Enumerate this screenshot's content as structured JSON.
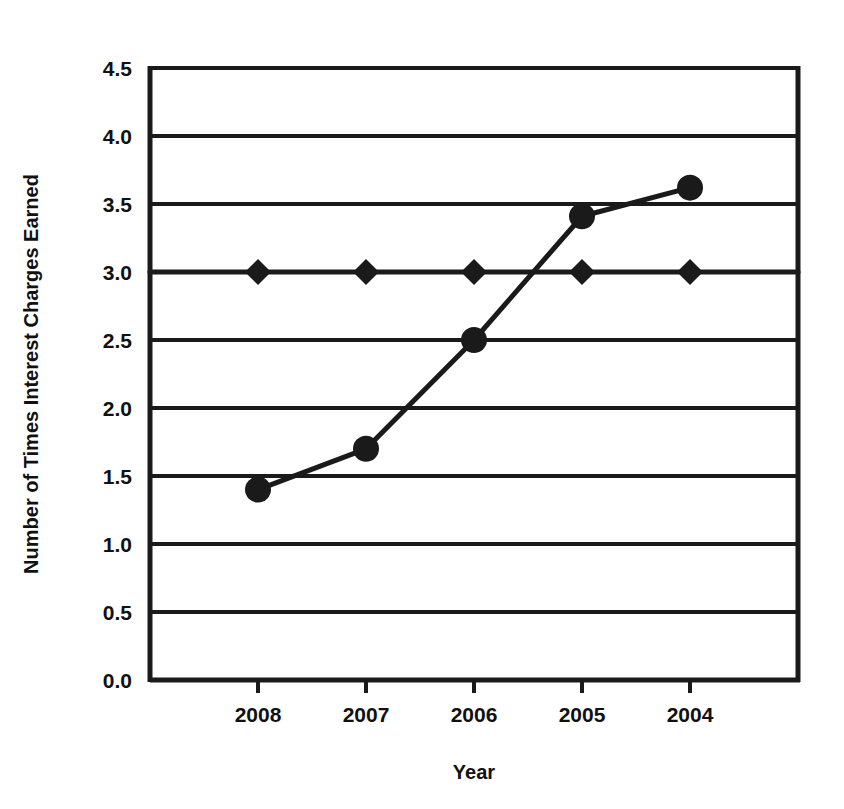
{
  "chart_data": {
    "type": "line",
    "title": "",
    "subtitle": "",
    "xlabel": "Year",
    "ylabel": "Number of Times Interest Charges Earned",
    "categories": [
      "2008",
      "2007",
      "2006",
      "2005",
      "2004"
    ],
    "xtick_labels": [
      "2008",
      "2007",
      "2006",
      "2005",
      "2004"
    ],
    "ytick_labels": [
      "0.0",
      "0.5",
      "1.0",
      "1.5",
      "2.0",
      "2.5",
      "3.0",
      "3.5",
      "4.0",
      "4.5"
    ],
    "ytick_values": [
      0.0,
      0.5,
      1.0,
      1.5,
      2.0,
      2.5,
      3.0,
      3.5,
      4.0,
      4.5
    ],
    "ylim": [
      0.0,
      4.5
    ],
    "grid": "horizontal",
    "legend_position": "none",
    "series": [
      {
        "name": "Number of Times Interest Charges Earned",
        "marker": "circle",
        "values": [
          1.4,
          1.7,
          2.5,
          3.41,
          3.62
        ]
      },
      {
        "name": "Benchmark",
        "marker": "diamond",
        "values": [
          3.0,
          3.0,
          3.0,
          3.0,
          3.0
        ]
      }
    ],
    "colors": {
      "line": "#1a1a1a",
      "marker": "#1a1a1a",
      "axis": "#1a1a1a",
      "grid": "#1a1a1a",
      "background": "#ffffff"
    }
  }
}
